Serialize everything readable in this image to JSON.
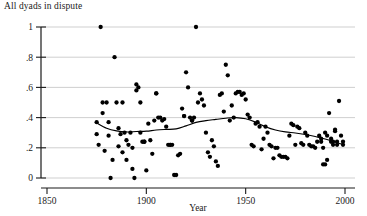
{
  "chart_data": {
    "type": "scatter",
    "title": "All dyads in dispute",
    "xlabel": "Year",
    "ylabel": "",
    "xlim": [
      1850,
      2000
    ],
    "ylim": [
      0,
      1
    ],
    "xticks": [
      1850,
      1900,
      1950,
      2000
    ],
    "xtick_labels": [
      "1850",
      "1900",
      "1950",
      "2000"
    ],
    "yticks": [
      0,
      0.2,
      0.4,
      0.6,
      0.8,
      1
    ],
    "ytick_labels": [
      "0",
      ".2",
      ".4",
      ".6",
      ".8",
      "1"
    ],
    "grid": "horizontal",
    "legend": "none",
    "marker": "filled-circle",
    "marker_color": "#000000",
    "points": [
      [
        1875,
        0.37
      ],
      [
        1875,
        0.29
      ],
      [
        1876,
        0.22
      ],
      [
        1877,
        1.0
      ],
      [
        1878,
        0.43
      ],
      [
        1878,
        0.5
      ],
      [
        1879,
        0.18
      ],
      [
        1880,
        0.5
      ],
      [
        1881,
        0.37
      ],
      [
        1881,
        0.28
      ],
      [
        1882,
        0.0
      ],
      [
        1883,
        0.12
      ],
      [
        1884,
        0.8
      ],
      [
        1885,
        0.5
      ],
      [
        1886,
        0.33
      ],
      [
        1886,
        0.21
      ],
      [
        1887,
        0.29
      ],
      [
        1888,
        0.5
      ],
      [
        1888,
        0.17
      ],
      [
        1889,
        0.3
      ],
      [
        1890,
        0.25
      ],
      [
        1890,
        0.12
      ],
      [
        1891,
        0.22
      ],
      [
        1892,
        0.3
      ],
      [
        1893,
        0.2
      ],
      [
        1893,
        0.06
      ],
      [
        1894,
        0.0
      ],
      [
        1895,
        0.58
      ],
      [
        1895,
        0.62
      ],
      [
        1896,
        0.6
      ],
      [
        1897,
        0.5
      ],
      [
        1897,
        0.3
      ],
      [
        1898,
        0.24
      ],
      [
        1899,
        0.24
      ],
      [
        1899,
        0.24
      ],
      [
        1900,
        0.05
      ],
      [
        1901,
        0.36
      ],
      [
        1902,
        0.25
      ],
      [
        1903,
        0.16
      ],
      [
        1904,
        0.38
      ],
      [
        1905,
        0.56
      ],
      [
        1905,
        0.56
      ],
      [
        1906,
        0.4
      ],
      [
        1907,
        0.4
      ],
      [
        1908,
        0.38
      ],
      [
        1909,
        0.39
      ],
      [
        1910,
        0.34
      ],
      [
        1911,
        0.22
      ],
      [
        1912,
        0.22
      ],
      [
        1912,
        0.22
      ],
      [
        1913,
        0.22
      ],
      [
        1914,
        0.02
      ],
      [
        1915,
        0.02
      ],
      [
        1916,
        0.15
      ],
      [
        1917,
        0.16
      ],
      [
        1918,
        0.46
      ],
      [
        1919,
        0.41
      ],
      [
        1919,
        0.41
      ],
      [
        1920,
        0.7
      ],
      [
        1921,
        0.6
      ],
      [
        1922,
        0.4
      ],
      [
        1923,
        0.38
      ],
      [
        1923,
        0.38
      ],
      [
        1924,
        0.4
      ],
      [
        1925,
        1.0
      ],
      [
        1926,
        0.5
      ],
      [
        1927,
        0.56
      ],
      [
        1928,
        0.52
      ],
      [
        1929,
        0.48
      ],
      [
        1930,
        0.3
      ],
      [
        1931,
        0.17
      ],
      [
        1932,
        0.14
      ],
      [
        1933,
        0.25
      ],
      [
        1934,
        0.21
      ],
      [
        1935,
        0.11
      ],
      [
        1936,
        0.08
      ],
      [
        1937,
        0.55
      ],
      [
        1938,
        0.56
      ],
      [
        1939,
        0.44
      ],
      [
        1940,
        0.75
      ],
      [
        1941,
        0.68
      ],
      [
        1942,
        0.38
      ],
      [
        1943,
        0.48
      ],
      [
        1944,
        0.4
      ],
      [
        1945,
        0.56
      ],
      [
        1946,
        0.57
      ],
      [
        1947,
        0.57
      ],
      [
        1948,
        0.55
      ],
      [
        1949,
        0.56
      ],
      [
        1950,
        0.52
      ],
      [
        1951,
        0.42
      ],
      [
        1952,
        0.4
      ],
      [
        1953,
        0.22
      ],
      [
        1954,
        0.21
      ],
      [
        1955,
        0.36
      ],
      [
        1956,
        0.37
      ],
      [
        1957,
        0.34
      ],
      [
        1958,
        0.19
      ],
      [
        1959,
        0.26
      ],
      [
        1960,
        0.34
      ],
      [
        1961,
        0.3
      ],
      [
        1962,
        0.22
      ],
      [
        1963,
        0.21
      ],
      [
        1964,
        0.13
      ],
      [
        1965,
        0.2
      ],
      [
        1966,
        0.2
      ],
      [
        1967,
        0.15
      ],
      [
        1968,
        0.14
      ],
      [
        1969,
        0.14
      ],
      [
        1970,
        0.14
      ],
      [
        1971,
        0.13
      ],
      [
        1972,
        0.28
      ],
      [
        1973,
        0.36
      ],
      [
        1974,
        0.35
      ],
      [
        1975,
        0.22
      ],
      [
        1976,
        0.34
      ],
      [
        1977,
        0.33
      ],
      [
        1978,
        0.23
      ],
      [
        1979,
        0.22
      ],
      [
        1980,
        0.3
      ],
      [
        1981,
        0.28
      ],
      [
        1982,
        0.22
      ],
      [
        1983,
        0.21
      ],
      [
        1984,
        0.21
      ],
      [
        1985,
        0.2
      ],
      [
        1986,
        0.24
      ],
      [
        1987,
        0.28
      ],
      [
        1988,
        0.26
      ],
      [
        1988,
        0.24
      ],
      [
        1989,
        0.2
      ],
      [
        1989,
        0.09
      ],
      [
        1990,
        0.09
      ],
      [
        1990,
        0.3
      ],
      [
        1991,
        0.28
      ],
      [
        1991,
        0.12
      ],
      [
        1992,
        0.43
      ],
      [
        1993,
        0.26
      ],
      [
        1993,
        0.24
      ],
      [
        1994,
        0.24
      ],
      [
        1994,
        0.22
      ],
      [
        1995,
        0.32
      ],
      [
        1995,
        0.31
      ],
      [
        1996,
        0.24
      ],
      [
        1996,
        0.22
      ],
      [
        1997,
        0.51
      ],
      [
        1998,
        0.28
      ],
      [
        1999,
        0.24
      ],
      [
        1999,
        0.22
      ]
    ],
    "trend_line": {
      "name": "lowess-smoother",
      "color": "#000000",
      "points": [
        [
          1875,
          0.365
        ],
        [
          1880,
          0.33
        ],
        [
          1885,
          0.312
        ],
        [
          1890,
          0.305
        ],
        [
          1895,
          0.308
        ],
        [
          1900,
          0.31
        ],
        [
          1905,
          0.318
        ],
        [
          1910,
          0.322
        ],
        [
          1915,
          0.325
        ],
        [
          1920,
          0.345
        ],
        [
          1925,
          0.368
        ],
        [
          1930,
          0.38
        ],
        [
          1935,
          0.388
        ],
        [
          1940,
          0.396
        ],
        [
          1945,
          0.4
        ],
        [
          1950,
          0.392
        ],
        [
          1955,
          0.37
        ],
        [
          1960,
          0.34
        ],
        [
          1965,
          0.318
        ],
        [
          1970,
          0.305
        ],
        [
          1975,
          0.298
        ],
        [
          1980,
          0.288
        ],
        [
          1985,
          0.275
        ],
        [
          1990,
          0.258
        ],
        [
          1995,
          0.238
        ],
        [
          1999,
          0.222
        ]
      ]
    }
  }
}
